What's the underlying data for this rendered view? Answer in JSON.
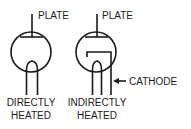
{
  "diagram": {
    "tubes": [
      {
        "id": "directly-heated",
        "plate_label": "PLATE",
        "caption_line1": "DIRECTLY",
        "caption_line2": "HEATED"
      },
      {
        "id": "indirectly-heated",
        "plate_label": "PLATE",
        "cathode_label": "CATHODE",
        "caption_line1": "INDIRECTLY",
        "caption_line2": "HEATED"
      }
    ],
    "colors": {
      "stroke": "#1a1a1a",
      "background": "#ffffff"
    }
  }
}
